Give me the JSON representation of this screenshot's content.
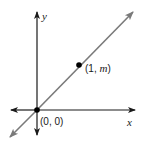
{
  "diagram": {
    "axes": {
      "x_label": "x",
      "y_label": "y"
    },
    "line": {
      "description": "line through origin with slope m",
      "color": "#7a7a7a"
    },
    "points": [
      {
        "label": "(0, 0)",
        "prefix": "(0, 0)"
      },
      {
        "label": "(1, m)",
        "prefix": "(1, ",
        "var": "m",
        "suffix": ")"
      }
    ],
    "axis_color": "#1a1a1a",
    "point_color": "#000000"
  }
}
